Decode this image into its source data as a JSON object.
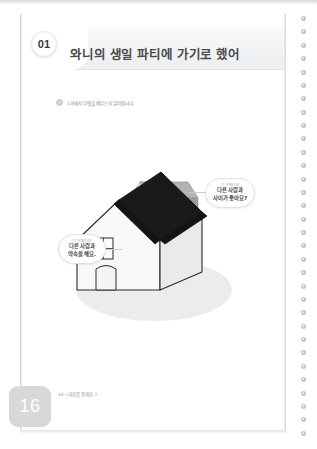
{
  "document": {
    "language": "ko",
    "page_number_label": "16",
    "footer_text": "16 • 대화를 잘해요 2"
  },
  "header": {
    "unit_badge": "01",
    "title": "와니의 생일 파티에 가기로 했어"
  },
  "instruction": {
    "bullet_icon": "circle-bullet-icon",
    "text": "1과에서 무엇을 배우는지 알아봅시다."
  },
  "illustration": {
    "name": "isometric-house-illustration",
    "ground_shadow_color": "#ebebeb",
    "main_house": {
      "wall_front_color": "#f7f7f5",
      "wall_side_color": "#e8e8e6",
      "roof_color": "#1c1c1c",
      "outline_color": "#2b2b2b",
      "window_label": "house-window",
      "door_label": "house-door"
    },
    "back_house": {
      "wall_color": "#fbfbfa",
      "roof_color": "#9a9a9a",
      "roof_shade_color": "#b8b8b8"
    }
  },
  "bubbles": [
    {
      "id": "bubble-right",
      "position": "right",
      "kicker": "이 과에서는요",
      "lines": [
        "다른 사람과",
        "사이가 좋아요?"
      ]
    },
    {
      "id": "bubble-left",
      "position": "left",
      "kicker": "이 과에서는요",
      "lines": [
        "다른 사람과",
        "약속을 해요."
      ]
    }
  ],
  "binding": {
    "dot_count": 32,
    "dot_color": "#b6b8bc"
  },
  "colors": {
    "page_background": "#ffffff",
    "header_band": "#f2f3f5",
    "title_text": "#4a4a4a",
    "muted_text": "#8a8c90",
    "page_tab": "#d7d8da"
  }
}
